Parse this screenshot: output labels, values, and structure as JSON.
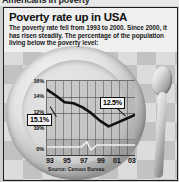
{
  "scrap": {
    "top_cropped_text": "Americans in poverty"
  },
  "graphic": {
    "headline": "Poverty rate up in USA",
    "deck": "The poverty rate fell from 1993 to 2000. Since 2000, it has risen steadily. The percentage of the population living below the poverty level:",
    "source": "Source: Census Bureau",
    "callouts": {
      "start_label": "15.1%",
      "end_label": "12.5%"
    },
    "background": {
      "plate": "dinner-plate",
      "utensil": "spoon",
      "tablecloth": "checkered"
    }
  },
  "colors": {
    "line": "#111111",
    "frame": "#1d1d1d",
    "plot_fill": "#b0b0b0",
    "callout_bg": "#f3f3f3",
    "text": "#111111"
  },
  "chart_data": {
    "type": "line",
    "title": "Poverty rate up in USA",
    "xlabel": "",
    "ylabel": "",
    "ylim": [
      9,
      16
    ],
    "ytick_labels": [
      "16%",
      "14%",
      "12%",
      "10%",
      "0%"
    ],
    "ytick_values": [
      16,
      14,
      12,
      10,
      0
    ],
    "axis_break": true,
    "grid": "vertical",
    "legend": "none",
    "x": [
      1993,
      1994,
      1995,
      1996,
      1997,
      1998,
      1999,
      2000,
      2001,
      2002,
      2003
    ],
    "xtick_labels": [
      "93",
      "95",
      "97",
      "99",
      "01",
      "03"
    ],
    "xtick_values": [
      1993,
      1995,
      1997,
      1999,
      2001,
      2003
    ],
    "series": [
      {
        "name": "Percentage of population below poverty level",
        "values": [
          15.1,
          14.5,
          13.8,
          13.7,
          13.3,
          12.7,
          11.9,
          11.3,
          11.7,
          12.1,
          12.5
        ]
      }
    ],
    "annotations": [
      {
        "label": "15.1%",
        "x": 1993,
        "y": 15.1
      },
      {
        "label": "12.5%",
        "x": 2003,
        "y": 12.5
      }
    ],
    "source": "Source: Census Bureau"
  }
}
